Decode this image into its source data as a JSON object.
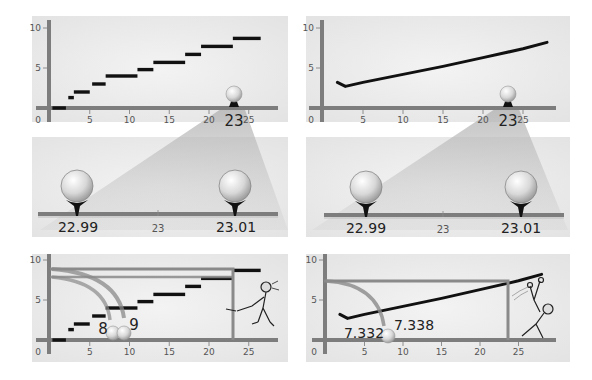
{
  "panels": {
    "top_left": {
      "kind": "step-function",
      "x_ticks": [
        "0",
        "5",
        "10",
        "15",
        "20",
        "25"
      ],
      "y_ticks": [
        "5",
        "10"
      ],
      "marker_label": "23"
    },
    "top_right": {
      "kind": "continuous-curve",
      "x_ticks": [
        "0",
        "5",
        "10",
        "15",
        "20",
        "25"
      ],
      "y_ticks": [
        "5",
        "10"
      ],
      "marker_label": "23"
    },
    "mid_left": {
      "left_label": "22.99",
      "center_label": "23",
      "right_label": "23.01"
    },
    "mid_right": {
      "left_label": "22.99",
      "center_label": "23",
      "right_label": "23.01"
    },
    "bottom_left": {
      "x_ticks": [
        "0",
        "5",
        "10",
        "15",
        "20",
        "25"
      ],
      "y_ticks": [
        "5",
        "10"
      ],
      "landing_left_label": "8",
      "landing_right_label": "9"
    },
    "bottom_right": {
      "x_ticks": [
        "0",
        "5",
        "10",
        "15",
        "20",
        "25"
      ],
      "y_ticks": [
        "5",
        "10"
      ],
      "landing_left_label": "7.332",
      "landing_right_label": "7.338"
    }
  },
  "chart_data": [
    {
      "type": "line",
      "title": "Step function",
      "xlim": [
        0,
        28
      ],
      "ylim": [
        0,
        10
      ],
      "series": [
        {
          "name": "steps",
          "segments": [
            {
              "x0": 0.3,
              "x1": 2,
              "y": 0
            },
            {
              "x0": 2.3,
              "x1": 3,
              "y": 1.3
            },
            {
              "x0": 3,
              "x1": 5,
              "y": 2
            },
            {
              "x0": 5.3,
              "x1": 7,
              "y": 3
            },
            {
              "x0": 7,
              "x1": 11,
              "y": 4
            },
            {
              "x0": 11,
              "x1": 13,
              "y": 4.8
            },
            {
              "x0": 13,
              "x1": 17,
              "y": 5.7
            },
            {
              "x0": 17,
              "x1": 19,
              "y": 6.7
            },
            {
              "x0": 19,
              "x1": 23,
              "y": 7.7
            },
            {
              "x0": 23,
              "x1": 26.5,
              "y": 8.7
            }
          ]
        }
      ],
      "highlight_x": 23
    },
    {
      "type": "line",
      "title": "Continuous curve",
      "xlim": [
        0,
        28
      ],
      "ylim": [
        0,
        10
      ],
      "series": [
        {
          "name": "curve",
          "x": [
            1.8,
            2.8,
            5,
            10,
            15,
            20,
            25,
            28
          ],
          "y": [
            3.2,
            2.7,
            3.2,
            4.2,
            5.2,
            6.3,
            7.4,
            8.2
          ]
        }
      ],
      "highlight_x": 23
    }
  ],
  "colors": {
    "panel_bg": "#ececec",
    "axis": "#7d7d7d",
    "mark": "#111111",
    "cone": "#bdbdbd",
    "guide": "#8a8a8a"
  }
}
